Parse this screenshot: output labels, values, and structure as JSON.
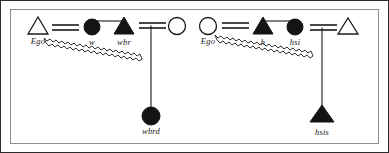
{
  "diagram": {
    "frame": {
      "outer_border_color": "#2b2b2b",
      "inner_border_color": "#8e8e8e",
      "background_color": "#ffffff"
    },
    "style": {
      "shape_stroke_color": "#1a1a1a",
      "shape_fill_solid": "#141414",
      "shape_fill_open": "#ffffff",
      "link_color": "#1a1a1a",
      "label_color": "#1a1a1a"
    },
    "groups": [
      {
        "id": "left-group",
        "ego_label": "Ego",
        "ego_shape": "open-triangle",
        "nodes": [
          {
            "id": "left-ego",
            "label": "Ego",
            "shape": "open-triangle",
            "x": 38,
            "y": 30,
            "label_x": 38,
            "label_y": 44
          },
          {
            "id": "left-w",
            "label": "w",
            "shape": "filled-circle",
            "x": 92,
            "y": 27,
            "label_x": 92,
            "label_y": 44
          },
          {
            "id": "left-wbr",
            "label": "wbr",
            "shape": "filled-triangle",
            "x": 124,
            "y": 30,
            "label_x": 124,
            "label_y": 44
          },
          {
            "id": "left-open",
            "label": "",
            "shape": "open-circle",
            "x": 177,
            "y": 26,
            "label_x": 177,
            "label_y": 44
          },
          {
            "id": "left-wbrd",
            "label": "wbrd",
            "shape": "filled-circle",
            "x": 151,
            "y": 116,
            "label_x": 151,
            "label_y": 133
          }
        ],
        "links": [
          {
            "type": "double-line",
            "from": "left-ego",
            "to": "left-w"
          },
          {
            "type": "single-line",
            "from": "left-w",
            "to": "left-wbr"
          },
          {
            "type": "double-line",
            "from": "left-wbr",
            "to": "left-open"
          },
          {
            "type": "vertical-drop",
            "from": "left-open",
            "to": "left-wbrd"
          },
          {
            "type": "zigzag",
            "from": "left-ego",
            "to": "left-wbrd"
          }
        ]
      },
      {
        "id": "right-group",
        "ego_label": "Ego",
        "ego_shape": "open-circle",
        "nodes": [
          {
            "id": "right-ego",
            "label": "Ego",
            "shape": "open-circle",
            "x": 208,
            "y": 26,
            "label_x": 208,
            "label_y": 44
          },
          {
            "id": "right-h",
            "label": "h",
            "shape": "filled-triangle",
            "x": 263,
            "y": 30,
            "label_x": 263,
            "label_y": 44
          },
          {
            "id": "right-hsi",
            "label": "hsi",
            "shape": "filled-circle",
            "x": 295,
            "y": 27,
            "label_x": 295,
            "label_y": 44
          },
          {
            "id": "right-open",
            "label": "",
            "shape": "open-triangle",
            "x": 348,
            "y": 30,
            "label_x": 348,
            "label_y": 44
          },
          {
            "id": "right-hsis",
            "label": "hsis",
            "shape": "filled-triangle",
            "x": 322,
            "y": 117,
            "label_x": 322,
            "label_y": 133
          }
        ],
        "links": [
          {
            "type": "double-line",
            "from": "right-ego",
            "to": "right-h"
          },
          {
            "type": "single-line",
            "from": "right-h",
            "to": "right-hsi"
          },
          {
            "type": "double-line",
            "from": "right-hsi",
            "to": "right-open"
          },
          {
            "type": "vertical-drop",
            "from": "right-open",
            "to": "right-hsis"
          },
          {
            "type": "zigzag",
            "from": "right-ego",
            "to": "right-hsis"
          }
        ]
      }
    ],
    "labels": {
      "left_ego": "Ego",
      "left_w": "w",
      "left_wbr": "wbr",
      "left_wbrd": "wbrd",
      "right_ego": "Ego",
      "right_h": "h",
      "right_hsi": "hsi",
      "right_hsis": "hsis"
    }
  }
}
